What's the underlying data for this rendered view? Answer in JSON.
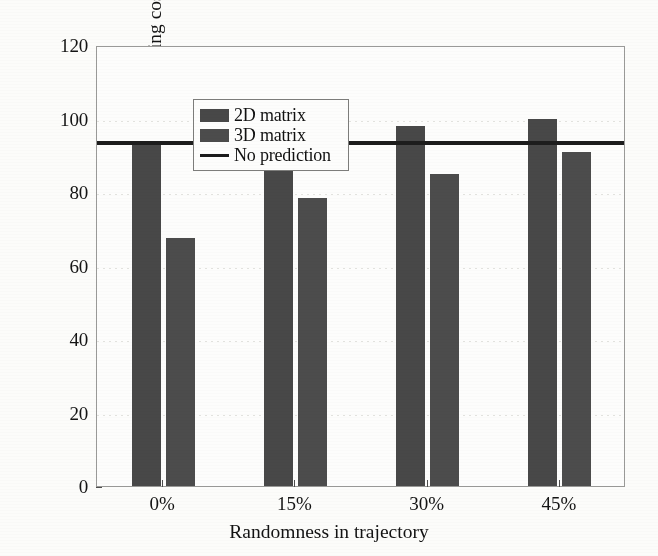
{
  "chart_data": {
    "type": "bar",
    "title": "",
    "xlabel": "Randomness in trajectory",
    "ylabel": "HO signalling cost",
    "categories": [
      "0%",
      "15%",
      "30%",
      "45%"
    ],
    "series": [
      {
        "name": "2D matrix",
        "values": [
          94,
          95.5,
          98,
          100
        ],
        "color": "#484848"
      },
      {
        "name": "3D matrix",
        "values": [
          67.5,
          78.5,
          85,
          91
        ],
        "color": "#4c4c4c"
      }
    ],
    "reference_line": {
      "name": "No prediction",
      "value": 94,
      "color": "#1d1d1d"
    },
    "ylim": [
      0,
      120
    ],
    "yticks": [
      0,
      20,
      40,
      60,
      80,
      100,
      120
    ],
    "ytick_labels": [
      "0",
      "20",
      "40",
      "60",
      "80",
      "100",
      "120"
    ],
    "grid": false,
    "legend_position": "upper-left",
    "legend_entries": [
      "2D matrix",
      "3D matrix",
      "No prediction"
    ]
  },
  "axes": {
    "y_title": "HO signalling cost",
    "x_title": "Randomness in trajectory"
  },
  "legend": {
    "items": [
      {
        "label": "2D matrix",
        "marker": "swatch"
      },
      {
        "label": "3D matrix",
        "marker": "swatch"
      },
      {
        "label": "No prediction",
        "marker": "line"
      }
    ]
  }
}
